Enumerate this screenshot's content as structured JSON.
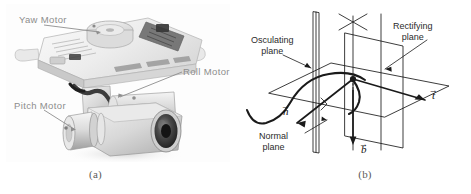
{
  "figure": {
    "type": "two-panel-academic-figure",
    "background_color": "#ffffff",
    "panels": [
      {
        "id": "a",
        "caption": "(a)",
        "kind": "photograph",
        "subject": "three-axis camera gimbal",
        "color_mode": "grayscale",
        "label_color": "#8d8d8d",
        "callouts": [
          {
            "name": "yaw-motor",
            "text": "Yaw Motor",
            "leader": "right-down"
          },
          {
            "name": "roll-motor",
            "text": "Roll Motor",
            "leader": "left-up"
          },
          {
            "name": "pitch-motor",
            "text": "Pitch Motor",
            "leader": "right"
          }
        ]
      },
      {
        "id": "b",
        "caption": "(b)",
        "kind": "line-diagram",
        "subject": "Frenet-Serret frame and associated planes",
        "line_color": "#1a1a1a",
        "planes": [
          {
            "name": "osculating-plane",
            "text": "Osculating\nplane",
            "line1": "Osculating",
            "line2": "plane"
          },
          {
            "name": "rectifying-plane",
            "text": "Rectifying\nplane",
            "line1": "Rectifying",
            "line2": "plane"
          },
          {
            "name": "normal-plane",
            "text": "Normal\nplane",
            "line1": "Normal",
            "line2": "plane"
          }
        ],
        "vectors": [
          {
            "name": "tangent-vector",
            "symbol": "t",
            "accent": "→",
            "direction": "right"
          },
          {
            "name": "normal-vector",
            "symbol": "n",
            "accent": "→",
            "direction": "lower-left"
          },
          {
            "name": "binormal-vector",
            "symbol": "b",
            "accent": "→",
            "direction": "down"
          }
        ],
        "curve": {
          "name": "space-curve",
          "style": "thick-solid-bold"
        }
      }
    ]
  },
  "colors": {
    "page_background": "#ffffff",
    "photo_label": "#8d8d8d",
    "diagram_ink": "#1a1a1a",
    "caption_ink": "#5b5b5b"
  }
}
